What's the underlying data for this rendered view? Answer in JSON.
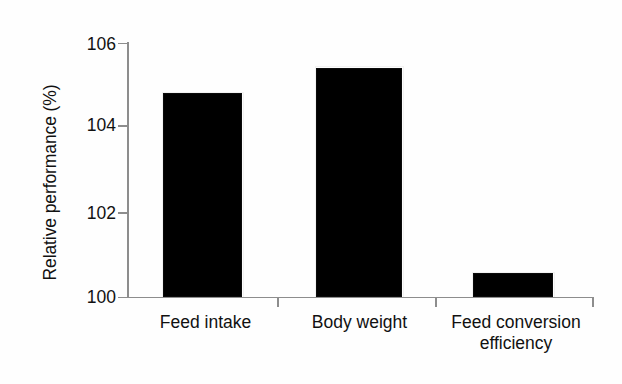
{
  "chart_data": {
    "type": "bar",
    "title": "",
    "subtitle": "",
    "xlabel": "",
    "ylabel": "Relative performance (%)",
    "categories": [
      "Feed intake",
      "Body weight",
      "Feed conversion efficiency"
    ],
    "category_lines": [
      [
        "Feed intake"
      ],
      [
        "Body weight"
      ],
      [
        "Feed conversion",
        "efficiency"
      ]
    ],
    "values": [
      104.8,
      105.4,
      100.55
    ],
    "ylim": [
      100,
      106
    ],
    "yticks": [
      100,
      102,
      104,
      106
    ],
    "ytick_labels": [
      "100",
      "102",
      "104",
      "106"
    ],
    "grid": false,
    "legend": null,
    "bar_color": "#000000",
    "axis_color": "#8d8d8d",
    "background_color": "#fefefe",
    "series": [
      {
        "name": "Relative performance",
        "values": [
          104.8,
          105.4,
          100.55
        ]
      }
    ]
  }
}
